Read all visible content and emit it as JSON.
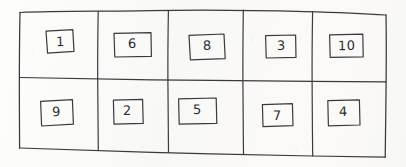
{
  "figure": {
    "kind": "hand-drawn-grid-diagram",
    "medium": "pencil-on-paper",
    "rows": 2,
    "columns": 5,
    "ink_color": "#3a3a3c",
    "paper_color": "#fbfbfa"
  },
  "grid": {
    "cells": [
      {
        "row": 0,
        "col": 0,
        "label": "1",
        "name": "grid-cell-r1c1"
      },
      {
        "row": 0,
        "col": 1,
        "label": "6",
        "name": "grid-cell-r1c2"
      },
      {
        "row": 0,
        "col": 2,
        "label": "8",
        "name": "grid-cell-r1c3"
      },
      {
        "row": 0,
        "col": 3,
        "label": "3",
        "name": "grid-cell-r1c4"
      },
      {
        "row": 0,
        "col": 4,
        "label": "10",
        "name": "grid-cell-r1c5"
      },
      {
        "row": 1,
        "col": 0,
        "label": "9",
        "name": "grid-cell-r2c1"
      },
      {
        "row": 1,
        "col": 1,
        "label": "2",
        "name": "grid-cell-r2c2"
      },
      {
        "row": 1,
        "col": 2,
        "label": "5",
        "name": "grid-cell-r2c3"
      },
      {
        "row": 1,
        "col": 3,
        "label": "7",
        "name": "grid-cell-r2c4"
      },
      {
        "row": 1,
        "col": 4,
        "label": "4",
        "name": "grid-cell-r2c5"
      }
    ],
    "top_row_labels": [
      "1",
      "6",
      "8",
      "3",
      "10"
    ],
    "bottom_row_labels": [
      "9",
      "2",
      "5",
      "7",
      "4"
    ]
  }
}
